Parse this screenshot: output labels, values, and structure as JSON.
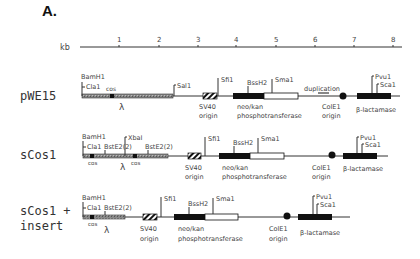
{
  "panel_label": "A.",
  "scale": {
    "unit": "kb",
    "ticks": [
      "1",
      "2",
      "3",
      "4",
      "5",
      "6",
      "7",
      "8"
    ]
  },
  "rows": [
    {
      "name": "pWE15",
      "labels": {
        "bamh1": "BamH1",
        "cla1": "Cla1",
        "cos": "cos",
        "sal1": "Sal1",
        "lambda": "λ",
        "sfi1": "Sfi1",
        "sv40_1": "SV40",
        "sv40_2": "origin",
        "bssh2": "BssH2",
        "sma1": "Sma1",
        "neo_1": "neo/kan",
        "neo_2": "phosphotransferase",
        "duplication": "duplication",
        "cole1_1": "ColE1",
        "cole1_2": "origin",
        "pvu1": "Pvu1",
        "sca1": "Sca1",
        "blact": "β-lactamase"
      }
    },
    {
      "name": "sCos1",
      "labels": {
        "bamh1": "BamH1",
        "cla1": "Cla1",
        "bste2a": "BstE2(2)",
        "xbai": "XbaI",
        "bste2b": "BstE2(2)",
        "cos_a": "cos",
        "cos_b": "cos",
        "lambda": "λ",
        "sfi1": "Sfi1",
        "sv40_1": "SV40",
        "sv40_2": "origin",
        "bssh2": "BssH2",
        "sma1": "Sma1",
        "neo_1": "neo/kan",
        "neo_2": "phosphotransferase",
        "cole1_1": "ColE1",
        "cole1_2": "origin",
        "pvu1": "Pvu1",
        "sca1": "Sca1",
        "blact": "β-lactamase"
      }
    },
    {
      "name_1": "sCos1 +",
      "name_2": "insert",
      "labels": {
        "bamh1": "BamH1",
        "cla1": "Cla1",
        "bste2": "BstE2(2)",
        "cos": "cos",
        "lambda": "λ",
        "sfi1": "Sfi1",
        "sv40_1": "SV40",
        "sv40_2": "origin",
        "bssh2": "BssH2",
        "sma1": "Sma1",
        "neo_1": "neo/kan",
        "neo_2": "phosphotransferase",
        "cole1_1": "ColE1",
        "cole1_2": "origin",
        "pvu1": "Pvu1",
        "sca1": "Sca1",
        "blact": "β-lactamase"
      }
    }
  ]
}
